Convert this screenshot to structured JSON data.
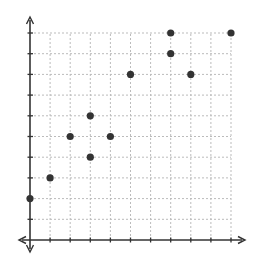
{
  "chart_data": {
    "type": "scatter",
    "title": "",
    "xlabel": "",
    "ylabel": "",
    "xlim": [
      0,
      10
    ],
    "ylim": [
      0,
      10
    ],
    "grid": true,
    "tick_labels_shown": false,
    "x": [
      0,
      1,
      2,
      3,
      3,
      4,
      5,
      7,
      7,
      8,
      10
    ],
    "y": [
      2,
      3,
      5,
      6,
      4,
      5,
      8,
      10,
      9,
      8,
      10
    ],
    "points": [
      {
        "x": 0,
        "y": 2
      },
      {
        "x": 1,
        "y": 3
      },
      {
        "x": 2,
        "y": 5
      },
      {
        "x": 3,
        "y": 6
      },
      {
        "x": 3,
        "y": 4
      },
      {
        "x": 4,
        "y": 5
      },
      {
        "x": 5,
        "y": 8
      },
      {
        "x": 7,
        "y": 10
      },
      {
        "x": 7,
        "y": 9
      },
      {
        "x": 8,
        "y": 8
      },
      {
        "x": 10,
        "y": 10
      }
    ],
    "colors": {
      "point": "#333333",
      "axis": "#333333",
      "grid": "#bbbbbb"
    }
  }
}
